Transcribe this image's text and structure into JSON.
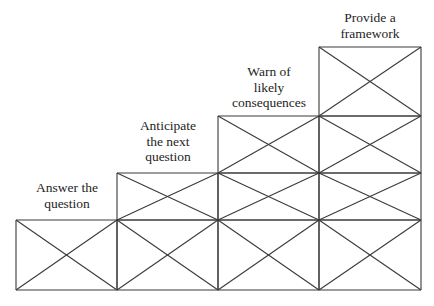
{
  "diagram": {
    "type": "staircase",
    "line_color": "#3a3a3a",
    "columns_x": [
      16,
      117,
      218,
      319,
      421
    ],
    "rows_y": [
      47,
      116,
      173,
      220,
      290
    ],
    "steps": [
      {
        "label_lines": [
          "Answer the",
          "question"
        ],
        "column": 0,
        "top_row": 3
      },
      {
        "label_lines": [
          "Anticipate",
          "the next",
          "question"
        ],
        "column": 1,
        "top_row": 2
      },
      {
        "label_lines": [
          "Warn of",
          "likely",
          "consequences"
        ],
        "column": 2,
        "top_row": 1
      },
      {
        "label_lines": [
          "Provide a",
          "framework"
        ],
        "column": 3,
        "top_row": 0
      }
    ]
  }
}
